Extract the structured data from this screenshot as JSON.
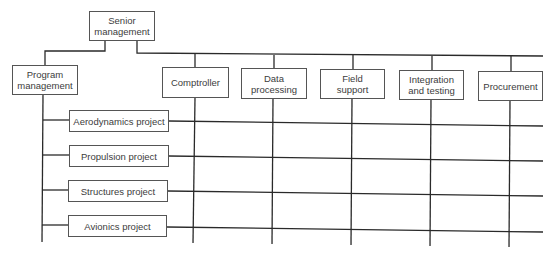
{
  "diagram": {
    "type": "matrix-organization-chart",
    "top": {
      "label": "Senior\nmanagement"
    },
    "left_branch": {
      "label": "Program\nmanagement"
    },
    "functional_departments": [
      {
        "label": "Comptroller"
      },
      {
        "label": "Data\nprocessing"
      },
      {
        "label": "Field\nsupport"
      },
      {
        "label": "Integration\nand testing"
      },
      {
        "label": "Procurement"
      }
    ],
    "projects": [
      {
        "label": "Aerodynamics project"
      },
      {
        "label": "Propulsion project"
      },
      {
        "label": "Structures project"
      },
      {
        "label": "Avionics project"
      }
    ],
    "colors": {
      "line": "#2a2a2a",
      "box_border": "#555555",
      "text": "#3c3c3c",
      "background": "#ffffff"
    }
  }
}
